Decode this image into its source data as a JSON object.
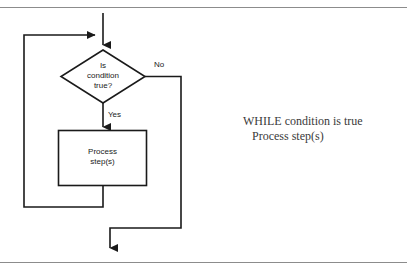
{
  "figure": {
    "type": "flowchart",
    "line_color": "#1a1a1a",
    "text_color": "#1a1a1a",
    "rule_color": "#8c8c8c",
    "background": "#ffffff"
  },
  "flowchart": {
    "nodes": [
      {
        "id": "decision",
        "shape": "diamond",
        "lines": [
          "Is",
          "condition",
          "true?"
        ],
        "text": "Is condition true?"
      },
      {
        "id": "process",
        "shape": "rectangle",
        "lines": [
          "Process",
          "step(s)"
        ],
        "text": "Process step(s)"
      }
    ],
    "edge_labels": [
      {
        "id": "no-label",
        "text": "No"
      },
      {
        "id": "yes-label",
        "text": "Yes"
      }
    ]
  },
  "pseudocode": {
    "line1": "WHILE condition is true",
    "line2": "Process step(s)"
  }
}
